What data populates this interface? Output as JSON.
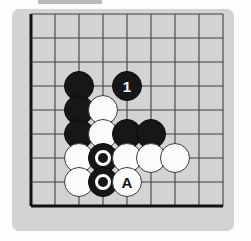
{
  "diagram": {
    "kind": "go-board-corner",
    "corner": "bottom-left",
    "grid": {
      "cols": 9,
      "rows": 9,
      "spacing_px": 24,
      "origin_x_px": 31,
      "origin_y_px": 14,
      "edge_lines": [
        "left",
        "bottom"
      ],
      "line_color": "#404040",
      "edge_color": "#111111",
      "board_color": "#d3d3d3"
    },
    "colors": {
      "black_stone": "#171717",
      "white_stone": "#fbfbfb",
      "panel": "#d3d3d3",
      "page": "#fdfdfd",
      "top_bar": "#b9b9b9"
    },
    "top_bar": {
      "visible": true
    },
    "stones": [
      {
        "id": "b1",
        "color": "black",
        "col": 2,
        "row": 3,
        "label": "",
        "marked": false
      },
      {
        "id": "b2",
        "color": "black",
        "col": 4,
        "row": 3,
        "label": "1",
        "marked": false
      },
      {
        "id": "b3",
        "color": "black",
        "col": 2,
        "row": 4,
        "label": "",
        "marked": false
      },
      {
        "id": "w1",
        "color": "white",
        "col": 3,
        "row": 4,
        "label": "",
        "marked": false
      },
      {
        "id": "b4",
        "color": "black",
        "col": 2,
        "row": 5,
        "label": "",
        "marked": false
      },
      {
        "id": "w2",
        "color": "white",
        "col": 3,
        "row": 5,
        "label": "",
        "marked": false
      },
      {
        "id": "b5",
        "color": "black",
        "col": 4,
        "row": 5,
        "label": "",
        "marked": false
      },
      {
        "id": "b6",
        "color": "black",
        "col": 5,
        "row": 5,
        "label": "",
        "marked": false
      },
      {
        "id": "w3",
        "color": "white",
        "col": 2,
        "row": 6,
        "label": "",
        "marked": false
      },
      {
        "id": "b7",
        "color": "black",
        "col": 3,
        "row": 6,
        "label": "",
        "marked": true
      },
      {
        "id": "w4",
        "color": "white",
        "col": 4,
        "row": 6,
        "label": "",
        "marked": false
      },
      {
        "id": "w5",
        "color": "white",
        "col": 5,
        "row": 6,
        "label": "",
        "marked": false
      },
      {
        "id": "w6",
        "color": "white",
        "col": 6,
        "row": 6,
        "label": "",
        "marked": false
      },
      {
        "id": "w7",
        "color": "white",
        "col": 2,
        "row": 7,
        "label": "",
        "marked": false
      },
      {
        "id": "b8",
        "color": "black",
        "col": 3,
        "row": 7,
        "label": "",
        "marked": true
      },
      {
        "id": "w8",
        "color": "white",
        "col": 4,
        "row": 7,
        "label": "A",
        "marked": false
      }
    ]
  }
}
